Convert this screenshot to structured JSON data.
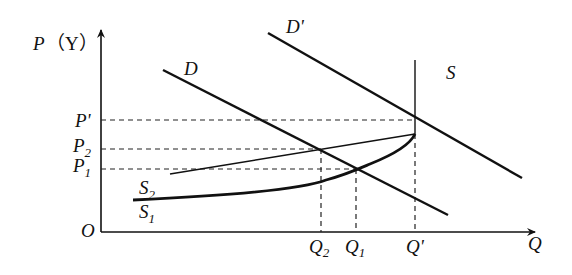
{
  "diagram": {
    "type": "supply-demand",
    "y_axis": {
      "label": "P",
      "unit": "（Y）"
    },
    "x_axis": {
      "label": "Q"
    },
    "origin_label": "O",
    "curves": {
      "D": {
        "label": "D"
      },
      "D_prime": {
        "label": "D'"
      },
      "S": {
        "label": "S"
      },
      "S1": {
        "label": "S",
        "sub": "1"
      },
      "S2": {
        "label": "S",
        "sub": "2"
      }
    },
    "price_levels": [
      {
        "label": "P'",
        "sub": ""
      },
      {
        "label": "P",
        "sub": "2"
      },
      {
        "label": "P",
        "sub": "1"
      }
    ],
    "quantity_levels": [
      {
        "label": "Q",
        "sub": "2"
      },
      {
        "label": "Q",
        "sub": "1"
      },
      {
        "label": "Q'",
        "sub": ""
      }
    ]
  }
}
